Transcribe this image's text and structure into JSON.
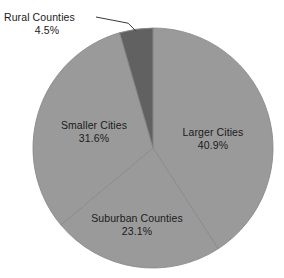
{
  "chart_data": {
    "type": "pie",
    "title": "",
    "subtitle": "",
    "xlabel": "",
    "ylabel": "",
    "legend_position": "none",
    "grid": false,
    "units": "percent",
    "start_angle_deg": 0,
    "direction": "clockwise",
    "categories": [
      "Larger Cities",
      "Suburban Counties",
      "Smaller Cities",
      "Rural Counties"
    ],
    "values": [
      40.9,
      23.1,
      31.6,
      4.5
    ],
    "labels": [
      "40.9%",
      "23.1%",
      "31.6%",
      "4.5%"
    ],
    "colors": [
      "#9a9a9a",
      "#9a9a9a",
      "#9a9a9a",
      "#616161"
    ],
    "slices": [
      {
        "name": "Larger Cities",
        "value": 40.9,
        "value_label": "40.9%",
        "color": "#9a9a9a",
        "label_placement": "inside"
      },
      {
        "name": "Suburban Counties",
        "value": 23.1,
        "value_label": "23.1%",
        "color": "#9a9a9a",
        "label_placement": "inside"
      },
      {
        "name": "Smaller Cities",
        "value": 31.6,
        "value_label": "31.6%",
        "color": "#9a9a9a",
        "label_placement": "inside"
      },
      {
        "name": "Rural Counties",
        "value": 4.5,
        "value_label": "4.5%",
        "color": "#616161",
        "label_placement": "outside-leader-line"
      }
    ]
  },
  "figure": {
    "background_color": "#ffffff",
    "text_color": "#1a1a1a",
    "slice_fill": "#9a9a9a",
    "highlight_slice_fill": "#616161",
    "divider_color": "#8a8a8a",
    "leader_line_color": "#3a3a3a",
    "center_x": 153,
    "center_y": 148,
    "radius": 120
  }
}
